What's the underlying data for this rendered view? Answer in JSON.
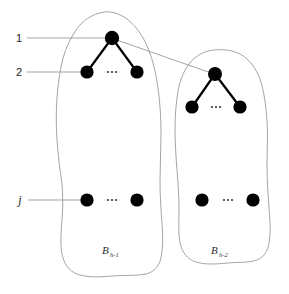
{
  "figure": {
    "background_color": "#ffffff",
    "node_color": "#000000",
    "edge_color": "#000000",
    "blob_outline_color": "#9a9a9a",
    "leader_line_color": "#9a9a9a",
    "cross_link_color": "#9a9a9a"
  },
  "level_labels": [
    {
      "id": "level-1",
      "text": "1"
    },
    {
      "id": "level-2",
      "text": "2"
    },
    {
      "id": "level-j",
      "text": "j"
    }
  ],
  "groups": [
    {
      "id": "group-left",
      "label_base": "B",
      "label_subscript": "h-1",
      "label_full": "B h-1"
    },
    {
      "id": "group-right",
      "label_base": "B",
      "label_subscript": "h-2",
      "label_full": "B h-2"
    }
  ],
  "ellipses": [
    {
      "id": "ellipsis-left-upper",
      "text": "..."
    },
    {
      "id": "ellipsis-left-lower",
      "text": "..."
    },
    {
      "id": "ellipsis-right-upper",
      "text": "..."
    },
    {
      "id": "ellipsis-right-lower",
      "text": "..."
    }
  ]
}
